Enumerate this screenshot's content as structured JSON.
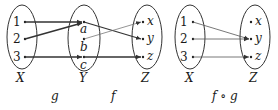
{
  "diagram": {
    "left": {
      "sets": {
        "X": {
          "label": "X",
          "elements": [
            "1",
            "2",
            "3"
          ]
        },
        "Y": {
          "label": "Y",
          "elements": [
            "a",
            "b",
            "c"
          ]
        },
        "Z": {
          "label": "Z",
          "elements": [
            "x",
            "y",
            "z"
          ]
        }
      },
      "functions": {
        "g": {
          "label": "g",
          "mapping": [
            [
              "1",
              "a"
            ],
            [
              "2",
              "a"
            ],
            [
              "3",
              "c"
            ]
          ]
        },
        "f": {
          "label": "f",
          "mapping": [
            [
              "a",
              "y"
            ],
            [
              "b",
              "x"
            ],
            [
              "c",
              "z"
            ]
          ]
        }
      }
    },
    "right": {
      "sets": {
        "X": {
          "label": "X",
          "elements": [
            "1",
            "2",
            "3"
          ]
        },
        "Z": {
          "label": "Z",
          "elements": [
            "x",
            "y",
            "z"
          ]
        }
      },
      "function": {
        "label": "f ∘ g",
        "mapping": [
          [
            "1",
            "y"
          ],
          [
            "2",
            "y"
          ],
          [
            "3",
            "z"
          ]
        ]
      }
    },
    "colors": {
      "stroke": "#333333",
      "thin_stroke": "#555555",
      "text": "#1a1a1a"
    }
  }
}
